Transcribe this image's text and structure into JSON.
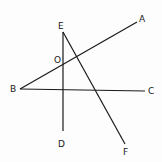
{
  "diagram": {
    "type": "geometry",
    "lines": [
      {
        "name": "BA",
        "x1": 20,
        "y1": 89,
        "x2": 137,
        "y2": 22
      },
      {
        "name": "BC",
        "x1": 20,
        "y1": 89,
        "x2": 145,
        "y2": 91
      },
      {
        "name": "ED",
        "x1": 63,
        "y1": 32,
        "x2": 63,
        "y2": 131
      },
      {
        "name": "EF",
        "x1": 63,
        "y1": 32,
        "x2": 125,
        "y2": 144
      }
    ],
    "labels": {
      "A": {
        "text": "A",
        "x": 139,
        "y": 22
      },
      "B": {
        "text": "B",
        "x": 10,
        "y": 92
      },
      "C": {
        "text": "C",
        "x": 148,
        "y": 94
      },
      "D": {
        "text": "D",
        "x": 58,
        "y": 147
      },
      "E": {
        "text": "E",
        "x": 58,
        "y": 29
      },
      "F": {
        "text": "F",
        "x": 123,
        "y": 155
      },
      "O": {
        "text": "O",
        "x": 54,
        "y": 63
      }
    }
  }
}
